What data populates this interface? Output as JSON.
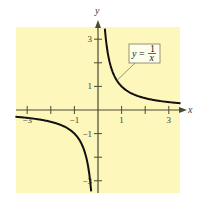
{
  "chart_data": {
    "type": "line",
    "title": "",
    "function": "y = 1/x",
    "xlabel": "x",
    "ylabel": "y",
    "xlim": [
      -3.5,
      3.5
    ],
    "ylim": [
      -3.5,
      3.5
    ],
    "grid": false,
    "x_ticks": [
      -3,
      -2,
      -1,
      1,
      2,
      3
    ],
    "y_ticks": [
      -3,
      -2,
      -1,
      1,
      2,
      3
    ],
    "x_tick_labels": [
      {
        "value": -3,
        "label": "−3"
      },
      {
        "value": -1,
        "label": "−1"
      },
      {
        "value": 1,
        "label": "1"
      },
      {
        "value": 3,
        "label": "3"
      }
    ],
    "y_tick_labels": [
      {
        "value": 3,
        "label": "3"
      },
      {
        "value": 1,
        "label": "1"
      },
      {
        "value": -1,
        "label": "−1"
      },
      {
        "value": -3,
        "label": "−3"
      }
    ],
    "series": [
      {
        "name": "positive branch",
        "x": [
          0.29,
          0.35,
          0.4,
          0.5,
          0.6,
          0.75,
          1,
          1.25,
          1.5,
          2,
          2.5,
          3,
          3.5
        ],
        "values": [
          3.45,
          2.86,
          2.5,
          2,
          1.67,
          1.33,
          1,
          0.8,
          0.67,
          0.5,
          0.4,
          0.33,
          0.29
        ]
      },
      {
        "name": "negative branch",
        "x": [
          -3.5,
          -3,
          -2.5,
          -2,
          -1.5,
          -1.25,
          -1,
          -0.75,
          -0.6,
          -0.5,
          -0.4,
          -0.35,
          -0.29
        ],
        "values": [
          -0.29,
          -0.33,
          -0.4,
          -0.5,
          -0.67,
          -0.8,
          -1,
          -1.33,
          -1.67,
          -2,
          -2.5,
          -2.86,
          -3.45
        ]
      }
    ],
    "annotations": [
      {
        "text": "y = 1/x",
        "lhs": "y",
        "equals": "=",
        "numerator": "1",
        "denominator": "x",
        "points_to": [
          0.8,
          1.25
        ]
      }
    ]
  },
  "colors": {
    "plot_background": "#FDF7BC",
    "axis": "#4a4a32",
    "curve": "#111111",
    "label_box_bg": "#FFFDEB",
    "label_box_border": "#7a7a5a"
  }
}
